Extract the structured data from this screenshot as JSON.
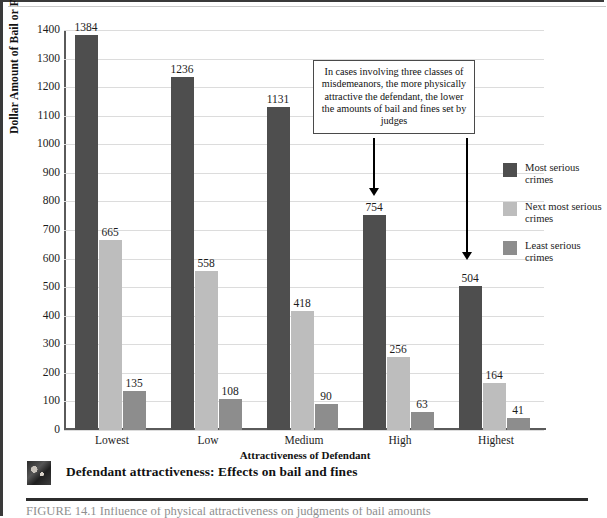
{
  "figure": {
    "caption": "Defendant attractiveness: Effects on bail and fines",
    "thumbnail_name": "defendant-photo-thumbnail",
    "footer_partial_text": "FIGURE 14.1  Influence of physical attractiveness on judgments of bail amounts"
  },
  "callout": {
    "text": "In cases involving three classes of misdemeanors, the more physically attractive the defendant, the lower the amounts of bail and fines set by judges",
    "arrows": [
      {
        "name": "callout-arrow-high",
        "x": 368,
        "top": 136,
        "length": 58
      },
      {
        "name": "callout-arrow-highest",
        "x": 461,
        "top": 136,
        "length": 122
      }
    ]
  },
  "legend": {
    "position": "right",
    "items": [
      {
        "label": "Most serious crimes",
        "color": "#4e4e4e"
      },
      {
        "label": "Next most serious crimes",
        "color": "#bdbdbd"
      },
      {
        "label": "Least serious crimes",
        "color": "#8d8d8d"
      }
    ]
  },
  "chart_data": {
    "type": "bar",
    "title": "",
    "xlabel": "Attractiveness of Defendant",
    "ylabel": "Dollar Amount of Bail or Fine Set by Judge",
    "categories": [
      "Lowest",
      "Low",
      "Medium",
      "High",
      "Highest"
    ],
    "ylim": [
      0,
      1400
    ],
    "yticks": [
      0,
      100,
      200,
      300,
      400,
      500,
      600,
      700,
      800,
      900,
      1000,
      1100,
      1200,
      1300,
      1400
    ],
    "grid": true,
    "series": [
      {
        "name": "Most serious crimes",
        "color": "#4e4e4e",
        "values": [
          1384,
          1236,
          1131,
          754,
          504
        ]
      },
      {
        "name": "Next most serious crimes",
        "color": "#bdbdbd",
        "values": [
          665,
          558,
          418,
          256,
          164
        ]
      },
      {
        "name": "Least serious crimes",
        "color": "#8d8d8d",
        "values": [
          135,
          108,
          90,
          63,
          41
        ]
      }
    ]
  }
}
